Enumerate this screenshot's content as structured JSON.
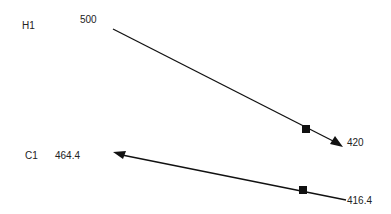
{
  "diagram": {
    "streams": [
      {
        "id": "H1",
        "label": "H1",
        "start_temp": "500",
        "end_temp": "420",
        "direction": "right",
        "color": "#111111"
      },
      {
        "id": "C1",
        "label": "C1",
        "start_temp": "416.4",
        "end_temp": "464.4",
        "direction": "left",
        "color": "#111111"
      }
    ]
  }
}
